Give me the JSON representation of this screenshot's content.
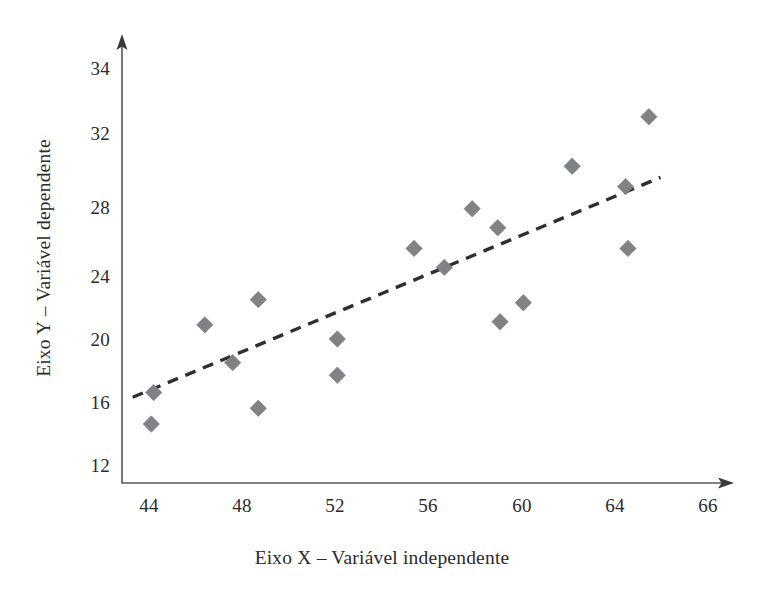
{
  "chart_data": {
    "type": "scatter",
    "title": "",
    "xlabel": "Eixo X – Variável independente",
    "ylabel": "Eixo Y – Variável dependente",
    "xlim": [
      42.8,
      67.0
    ],
    "ylim": [
      11.0,
      35.2
    ],
    "grid": false,
    "legend": null,
    "xticks": [
      44,
      48,
      52,
      56,
      60,
      64,
      66
    ],
    "xtick_labels": [
      "44",
      "48",
      "52",
      "56",
      "60",
      "64",
      "66"
    ],
    "yticks": [
      12,
      16,
      20,
      24,
      28,
      32,
      34
    ],
    "ytick_labels": [
      "12",
      "16",
      "20",
      "24",
      "28",
      "32",
      "34"
    ],
    "marker": "diamond",
    "marker_color": "#808285",
    "points": [
      {
        "x": 44.1,
        "y": 14.6
      },
      {
        "x": 44.2,
        "y": 16.6
      },
      {
        "x": 46.4,
        "y": 20.9
      },
      {
        "x": 47.6,
        "y": 18.5
      },
      {
        "x": 48.7,
        "y": 22.5
      },
      {
        "x": 48.7,
        "y": 15.6
      },
      {
        "x": 52.1,
        "y": 20.0
      },
      {
        "x": 52.1,
        "y": 17.7
      },
      {
        "x": 55.4,
        "y": 25.6
      },
      {
        "x": 56.7,
        "y": 24.5
      },
      {
        "x": 57.9,
        "y": 27.9
      },
      {
        "x": 59.0,
        "y": 26.8
      },
      {
        "x": 59.1,
        "y": 21.1
      },
      {
        "x": 60.1,
        "y": 22.3
      },
      {
        "x": 62.2,
        "y": 30.2
      },
      {
        "x": 64.5,
        "y": 29.1
      },
      {
        "x": 64.6,
        "y": 25.6
      },
      {
        "x": 65.5,
        "y": 32.5
      }
    ],
    "trend_line": {
      "style": "dashed",
      "color": "#2f2f33",
      "x_start": 43.3,
      "y_start": 16.3,
      "x_end": 66.0,
      "y_end": 29.6
    }
  },
  "axes": {
    "x_axis_title": "Eixo X – Variável independente",
    "y_axis_title": "Eixo Y – Variável dependente",
    "x_tick_labels": [
      "44",
      "48",
      "52",
      "56",
      "60",
      "64",
      "66"
    ],
    "y_tick_labels": [
      "12",
      "16",
      "20",
      "24",
      "28",
      "32",
      "34"
    ]
  }
}
